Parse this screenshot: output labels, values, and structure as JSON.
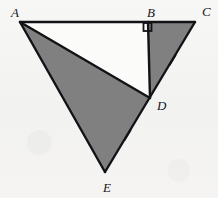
{
  "figure": {
    "background_color": "#f4f4f4",
    "stroke_color": "#121317",
    "shade_color": "#808080",
    "unshaded_color": "#fbfbfa",
    "stroke_width": 2.4
  },
  "vertices": [
    {
      "id": "A",
      "label": "A",
      "x": 20,
      "y": 22,
      "label_x": 11,
      "label_y": 17
    },
    {
      "id": "B",
      "label": "B",
      "x": 148,
      "y": 22,
      "label_x": 147,
      "label_y": 17
    },
    {
      "id": "C",
      "label": "C",
      "x": 195,
      "y": 22,
      "label_x": 202,
      "label_y": 16
    },
    {
      "id": "D",
      "label": "D",
      "x": 150,
      "y": 98,
      "label_x": 157,
      "label_y": 110
    },
    {
      "id": "E",
      "label": "E",
      "x": 105,
      "y": 172,
      "label_x": 103,
      "label_y": 192
    }
  ],
  "segments": [
    {
      "id": "AC",
      "from": "A",
      "to": "C",
      "description": "top horizontal segment through B"
    },
    {
      "id": "AE",
      "from": "A",
      "to": "E",
      "description": "left long side"
    },
    {
      "id": "AD",
      "from": "A",
      "to": "D",
      "description": "interior cevian from A to D"
    },
    {
      "id": "BD",
      "from": "B",
      "to": "D",
      "description": "vertical altitude from B to D"
    },
    {
      "id": "CE",
      "from": "C",
      "to": "E",
      "description": "right side through D"
    }
  ],
  "shaded_regions": [
    {
      "id": "BDC",
      "points": "148,22 195,22 150,98",
      "fill": "#808080",
      "description": "small right triangle B-C-D, shaded"
    },
    {
      "id": "ADE",
      "points": "20,22 150,98 105,172",
      "fill": "#808080",
      "description": "large triangle A-D-E, shaded"
    }
  ],
  "unshaded_regions": [
    {
      "id": "ABD",
      "points": "20,22 148,22 150,98",
      "fill": "#fbfbfa",
      "description": "triangle A-B-D, white / unshaded"
    }
  ],
  "right_angle": {
    "at_vertex": "B",
    "symbol": "square",
    "x": 143.5,
    "y": 23,
    "size": 8,
    "description": "right angle mark at B between BA and BD"
  },
  "tick_marks": [
    {
      "id": "tick-DC",
      "on_segment": "DC",
      "count": 1,
      "x": 172.5,
      "y": 60.0,
      "angle_deg": -58.6,
      "length": 11,
      "description": "congruence tick on segment D-C"
    },
    {
      "id": "tick-DE",
      "on_segment": "DE",
      "count": 1,
      "x": 127.5,
      "y": 135.0,
      "angle_deg": -58.6,
      "length": 11,
      "description": "congruence tick on segment D-E"
    }
  ],
  "congruence_note": "Single tick on DC and single tick on DE indicates DC is congruent to DE"
}
